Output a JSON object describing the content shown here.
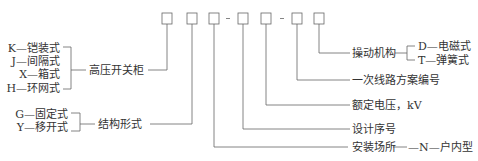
{
  "code": {
    "boxes": 7,
    "separators": [
      "-",
      "-"
    ]
  },
  "left_groups": {
    "cabinet_type": {
      "options": [
        "K—铠装式",
        "J—间隔式",
        "X—箱式",
        "H—环网式"
      ],
      "label": "高压开关柜"
    },
    "structure": {
      "options": [
        "G—固定式",
        "Y—移开式"
      ],
      "label": "结构形式"
    }
  },
  "right_groups": {
    "operating_mechanism": {
      "label": "操动机构",
      "options": [
        "D—电磁式",
        "T—弹簧式"
      ]
    },
    "primary_circuit": {
      "label": "一次线路方案编号"
    },
    "rated_voltage": {
      "label": "额定电压，kV"
    },
    "design_serial": {
      "label": "设计序号"
    },
    "installation_site": {
      "label": "安装场所",
      "option": "—N—户内型"
    }
  },
  "colors": {
    "line": "#555555",
    "text": "#333333"
  }
}
